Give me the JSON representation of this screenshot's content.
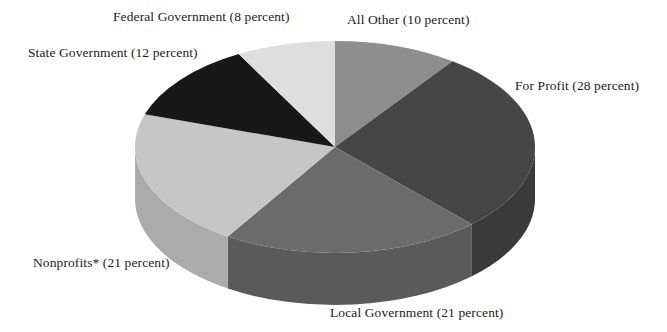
{
  "chart_data": {
    "type": "pie",
    "title": "",
    "subtitle": "",
    "xlabel": "",
    "ylabel": "",
    "legend_position": "none",
    "grid": false,
    "units": "percent",
    "total": 100,
    "three_d": true,
    "start_angle_deg": 0,
    "direction": "clockwise",
    "categories": [
      "All Other",
      "For Profit",
      "Local Government",
      "Nonprofits*",
      "State Government",
      "Federal Government"
    ],
    "values": [
      10,
      28,
      21,
      21,
      12,
      8
    ],
    "labels": [
      "All Other (10 percent)",
      "For Profit (28 percent)",
      "Local Government (21 percent)",
      "Nonprofits* (21 percent)",
      "State Government (12 percent)",
      "Federal Government (8 percent)"
    ],
    "slices": [
      {
        "name": "All Other",
        "value": 10,
        "label": "All Other (10 percent)",
        "color": "#8e8e8e",
        "side_color": "#7a7a7a"
      },
      {
        "name": "For Profit",
        "value": 28,
        "label": "For Profit (28 percent)",
        "color": "#464646",
        "side_color": "#3a3a3a"
      },
      {
        "name": "Local Government",
        "value": 21,
        "label": "Local Government (21 percent)",
        "color": "#6b6b6b",
        "side_color": "#5a5a5a"
      },
      {
        "name": "Nonprofits*",
        "value": 21,
        "label": "Nonprofits* (21 percent)",
        "color": "#c6c6c6",
        "side_color": "#ababab"
      },
      {
        "name": "State Government",
        "value": 12,
        "label": "State Government (12 percent)",
        "color": "#181818",
        "side_color": "#141414"
      },
      {
        "name": "Federal Government",
        "value": 8,
        "label": "Federal Government (8 percent)",
        "color": "#dedede",
        "side_color": "#c2c2c2"
      }
    ],
    "colors": {
      "background": "#ffffff",
      "text": "#1c1c1c",
      "all_other": "#8e8e8e",
      "for_profit": "#464646",
      "local_government": "#6b6b6b",
      "nonprofits": "#c6c6c6",
      "state_government": "#181818",
      "federal_government": "#dedede"
    }
  }
}
